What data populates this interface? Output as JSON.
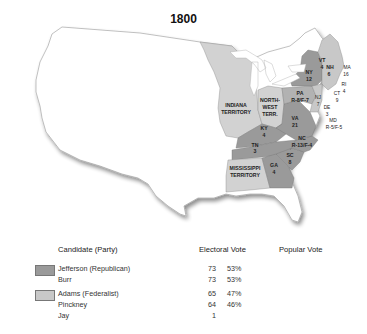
{
  "title": "1800",
  "colors": {
    "republican": "#9a9a9a",
    "federalist": "#c8c8c8",
    "territory": "#d2d2d2",
    "unorganized": "#ffffff"
  },
  "regions": [
    {
      "name": "INDIANA TERRITORY",
      "label1": "INDIANA",
      "label2": "TERRITORY",
      "party": "territory"
    },
    {
      "name": "NORTHWEST TERRITORY",
      "label1": "NORTH-",
      "label2": "WEST",
      "label3": "TERR.",
      "party": "territory"
    },
    {
      "name": "MISSISSIPPI TERRITORY",
      "label1": "MISSISSIPPI",
      "label2": "TERRITORY",
      "party": "territory"
    },
    {
      "abbr": "NY",
      "votes": "12",
      "party": "republican"
    },
    {
      "abbr": "PA",
      "votes": "R-8/F-7",
      "party": "split"
    },
    {
      "abbr": "VA",
      "votes": "21",
      "party": "republican"
    },
    {
      "abbr": "KY",
      "votes": "4",
      "party": "republican"
    },
    {
      "abbr": "TN",
      "votes": "3",
      "party": "republican"
    },
    {
      "abbr": "NC",
      "votes": "R-13/F-4",
      "party": "split"
    },
    {
      "abbr": "SC",
      "votes": "8",
      "party": "republican"
    },
    {
      "abbr": "GA",
      "votes": "4",
      "party": "republican"
    },
    {
      "abbr": "VT",
      "votes": "4",
      "party": "federalist"
    },
    {
      "abbr": "NH",
      "votes": "6",
      "party": "federalist"
    },
    {
      "abbr": "MA",
      "votes": "16",
      "party": "federalist"
    },
    {
      "abbr": "RI",
      "votes": "4",
      "party": "federalist"
    },
    {
      "abbr": "CT",
      "votes": "9",
      "party": "federalist"
    },
    {
      "abbr": "NJ",
      "votes": "7",
      "party": "federalist"
    },
    {
      "abbr": "DE",
      "votes": "3",
      "party": "federalist"
    },
    {
      "abbr": "MD",
      "votes": "R-5/F-5",
      "party": "split"
    }
  ],
  "legend": {
    "headers": {
      "candidate": "Candidate (Party)",
      "electoral": "Electoral Vote",
      "popular": "Popular Vote"
    },
    "rows": [
      {
        "candidate": "Jefferson (Republican)",
        "ev": "73",
        "pct": "53%",
        "swatch": "republican"
      },
      {
        "candidate": "Burr",
        "ev": "73",
        "pct": "53%"
      },
      {
        "candidate": "Adams (Federalist)",
        "ev": "65",
        "pct": "47%",
        "swatch": "federalist"
      },
      {
        "candidate": "Pinckney",
        "ev": "64",
        "pct": "46%"
      },
      {
        "candidate": "Jay",
        "ev": "1",
        "pct": ""
      }
    ]
  }
}
